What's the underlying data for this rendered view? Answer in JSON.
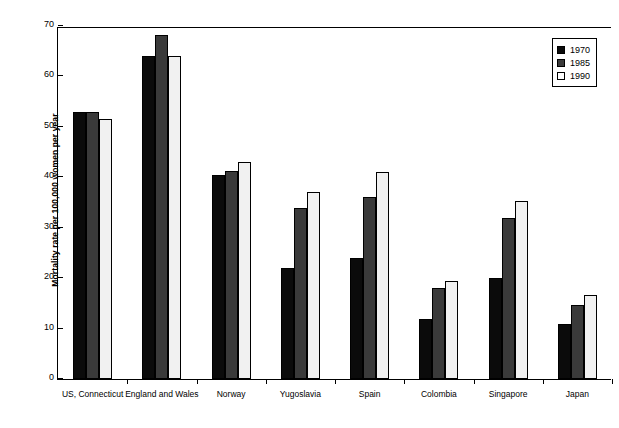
{
  "chart_data": {
    "type": "bar",
    "title": "",
    "xlabel": "",
    "ylabel": "Mortality rate per 100,000 women per year",
    "ylim": [
      0,
      70
    ],
    "yticks": [
      0,
      10,
      20,
      30,
      40,
      50,
      60,
      70
    ],
    "grid": false,
    "legend_position": "top-right",
    "categories": [
      "US, Connecticut",
      "England and Wales",
      "Norway",
      "Yugoslavia",
      "Spain",
      "Colombia",
      "Singapore",
      "Japan"
    ],
    "series": [
      {
        "name": "1970",
        "color": "#0b0b0b",
        "values": [
          53,
          64,
          40.5,
          22,
          24,
          12,
          20,
          11
        ]
      },
      {
        "name": "1985",
        "color": "#3a3a3a",
        "values": [
          53,
          68.2,
          41.2,
          34,
          36,
          18,
          32,
          14.7
        ]
      },
      {
        "name": "1990",
        "color": "#f1f1f1",
        "values": [
          51.5,
          64,
          43,
          37,
          41,
          19.5,
          35.3,
          16.7
        ]
      }
    ]
  },
  "legend": {
    "items": [
      {
        "label": "1970",
        "swatch": "s1970"
      },
      {
        "label": "1985",
        "swatch": "s1985"
      },
      {
        "label": "1990",
        "swatch": "s1990"
      }
    ]
  },
  "artifacts": {
    "top": "",
    "bottom": ""
  }
}
